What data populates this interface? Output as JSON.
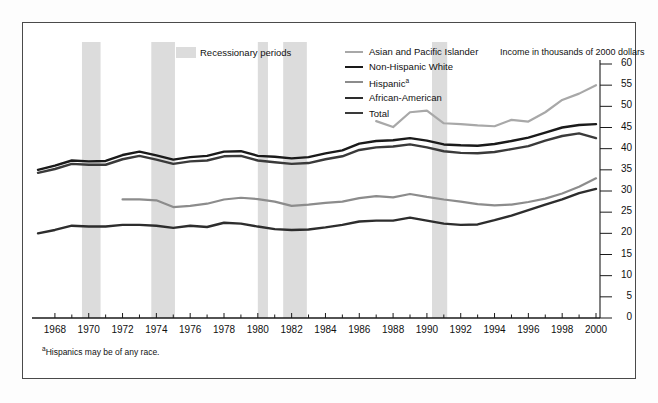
{
  "figure": {
    "recession_legend_label": "Recessionary periods",
    "axis_title": "Income in thousands of 2000 dollars",
    "footnote_marker": "a",
    "footnote_text": "Hispanics may be of any race."
  },
  "chart_data": {
    "type": "line",
    "title": "",
    "subtitle": "",
    "xlabel": "",
    "ylabel": "Income in thousands of 2000 dollars",
    "xlim": [
      1967,
      2000
    ],
    "ylim": [
      0,
      60
    ],
    "yticks": [
      0,
      5,
      10,
      15,
      20,
      25,
      30,
      35,
      40,
      45,
      50,
      55,
      60
    ],
    "xticks": [
      1968,
      1970,
      1972,
      1974,
      1976,
      1978,
      1980,
      1982,
      1984,
      1986,
      1988,
      1990,
      1992,
      1994,
      1996,
      1998,
      2000
    ],
    "xtick_minor_step": 1,
    "grid": false,
    "legend_position": "top",
    "shaded_regions": [
      {
        "label": "Recessionary periods",
        "x0": 1969.6,
        "x1": 1970.7,
        "color": "#dcdcdc"
      },
      {
        "label": "Recessionary periods",
        "x0": 1973.7,
        "x1": 1975.1,
        "color": "#dcdcdc"
      },
      {
        "label": "Recessionary periods",
        "x0": 1980.0,
        "x1": 1980.6,
        "color": "#dcdcdc"
      },
      {
        "label": "Recessionary periods",
        "x0": 1981.5,
        "x1": 1982.9,
        "color": "#dcdcdc"
      },
      {
        "label": "Recessionary periods",
        "x0": 1990.3,
        "x1": 1991.2,
        "color": "#dcdcdc"
      }
    ],
    "series": [
      {
        "name": "Asian and Pacific Islander",
        "color": "#a8a8a8",
        "width": 2.2,
        "x": [
          1987,
          1988,
          1989,
          1990,
          1991,
          1992,
          1993,
          1994,
          1995,
          1996,
          1997,
          1998,
          1999,
          2000
        ],
        "values": [
          46.5,
          45.1,
          48.6,
          49.0,
          46.0,
          45.8,
          45.5,
          45.3,
          46.8,
          46.4,
          48.6,
          51.5,
          53.0,
          55.0
        ]
      },
      {
        "name": "Non-Hispanic White",
        "color": "#1a1a1a",
        "width": 2.4,
        "x": [
          1967,
          1968,
          1969,
          1970,
          1971,
          1972,
          1973,
          1974,
          1975,
          1976,
          1977,
          1978,
          1979,
          1980,
          1981,
          1982,
          1983,
          1984,
          1985,
          1986,
          1987,
          1988,
          1989,
          1990,
          1991,
          1992,
          1993,
          1994,
          1995,
          1996,
          1997,
          1998,
          1999,
          2000
        ],
        "values": [
          35.0,
          36.0,
          37.2,
          37.0,
          37.1,
          38.5,
          39.3,
          38.4,
          37.4,
          38.0,
          38.3,
          39.3,
          39.4,
          38.3,
          38.1,
          37.7,
          38.0,
          38.9,
          39.6,
          41.2,
          41.8,
          42.0,
          42.5,
          41.9,
          41.0,
          40.8,
          40.7,
          41.1,
          41.8,
          42.6,
          43.8,
          45.0,
          45.6,
          45.8
        ]
      },
      {
        "name": "Hispanic",
        "color": "#8c8c8c",
        "width": 2.2,
        "x": [
          1972,
          1973,
          1974,
          1975,
          1976,
          1977,
          1978,
          1979,
          1980,
          1981,
          1982,
          1983,
          1984,
          1985,
          1986,
          1987,
          1988,
          1989,
          1990,
          1991,
          1992,
          1993,
          1994,
          1995,
          1996,
          1997,
          1998,
          1999,
          2000
        ],
        "values": [
          28.0,
          28.0,
          27.8,
          26.2,
          26.5,
          27.0,
          28.0,
          28.4,
          28.1,
          27.5,
          26.5,
          26.8,
          27.2,
          27.5,
          28.3,
          28.8,
          28.5,
          29.3,
          28.6,
          28.0,
          27.5,
          26.9,
          26.6,
          26.8,
          27.4,
          28.2,
          29.4,
          31.0,
          33.0
        ]
      },
      {
        "name": "African-American",
        "color": "#2d2d2d",
        "width": 2.4,
        "x": [
          1967,
          1968,
          1969,
          1970,
          1971,
          1972,
          1973,
          1974,
          1975,
          1976,
          1977,
          1978,
          1979,
          1980,
          1981,
          1982,
          1983,
          1984,
          1985,
          1986,
          1987,
          1988,
          1989,
          1990,
          1991,
          1992,
          1993,
          1994,
          1995,
          1996,
          1997,
          1998,
          1999,
          2000
        ],
        "values": [
          20.0,
          20.8,
          21.8,
          21.6,
          21.6,
          22.0,
          22.0,
          21.8,
          21.3,
          21.8,
          21.5,
          22.5,
          22.3,
          21.6,
          21.0,
          20.8,
          20.9,
          21.4,
          22.0,
          22.8,
          23.0,
          23.0,
          23.7,
          23.0,
          22.3,
          22.0,
          22.1,
          23.1,
          24.2,
          25.5,
          26.8,
          28.0,
          29.5,
          30.5
        ]
      },
      {
        "name": "Total",
        "color": "#3a3a3a",
        "width": 2.4,
        "x": [
          1967,
          1968,
          1969,
          1970,
          1971,
          1972,
          1973,
          1974,
          1975,
          1976,
          1977,
          1978,
          1979,
          1980,
          1981,
          1982,
          1983,
          1984,
          1985,
          1986,
          1987,
          1988,
          1989,
          1990,
          1991,
          1992,
          1993,
          1994,
          1995,
          1996,
          1997,
          1998,
          1999,
          2000
        ],
        "values": [
          34.3,
          35.2,
          36.4,
          36.2,
          36.2,
          37.5,
          38.3,
          37.4,
          36.4,
          37.0,
          37.2,
          38.2,
          38.3,
          37.2,
          36.8,
          36.4,
          36.6,
          37.5,
          38.2,
          39.7,
          40.3,
          40.5,
          41.0,
          40.3,
          39.4,
          39.0,
          38.9,
          39.2,
          39.9,
          40.6,
          41.9,
          43.0,
          43.6,
          42.5
        ]
      }
    ]
  }
}
